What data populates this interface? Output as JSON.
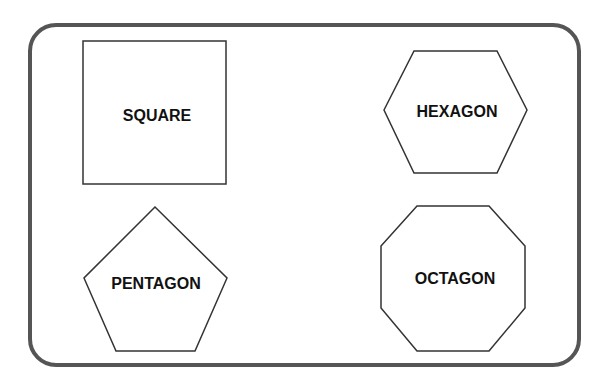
{
  "colors": {
    "frame": "#555555",
    "shape_stroke": "#333333",
    "text": "#111111"
  },
  "shapes": [
    {
      "name": "square",
      "label": "SQUARE"
    },
    {
      "name": "hexagon",
      "label": "HEXAGON"
    },
    {
      "name": "pentagon",
      "label": "PENTAGON"
    },
    {
      "name": "octagon",
      "label": "OCTAGON"
    }
  ]
}
